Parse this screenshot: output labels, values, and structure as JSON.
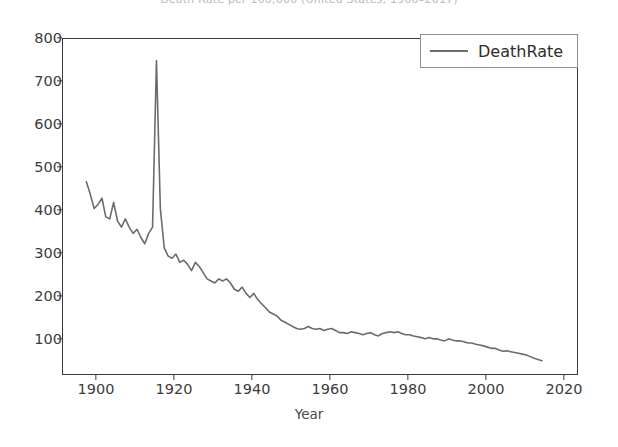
{
  "figure": {
    "clipped_title": "Death Rate per 100,000 (United States, 1900–2017)",
    "background_color": "#ffffff",
    "line_color": "#6b6b6b",
    "axis_color": "#3a3a3a"
  },
  "legend": {
    "position": "upper right",
    "label": "DeathRate",
    "swatch_name": "legend-line-swatch"
  },
  "axes": {
    "xlabel": "Year",
    "ylabel": "",
    "xticks": [
      1900,
      1920,
      1940,
      1960,
      1980,
      2000,
      2020
    ],
    "yticks": [
      100,
      200,
      300,
      400,
      500,
      600,
      700,
      800
    ],
    "xlim": [
      1894,
      2026
    ],
    "ylim": [
      20,
      830
    ],
    "grid": false
  },
  "chart_data": {
    "type": "line",
    "title": "Death Rate per 100,000 (United States, 1900–2017)",
    "xlabel": "Year",
    "ylabel": "",
    "xlim": [
      1894,
      2026
    ],
    "ylim": [
      20,
      830
    ],
    "grid": false,
    "legend_position": "upper right",
    "series": [
      {
        "name": "DeathRate",
        "color": "#6b6b6b",
        "x": [
          1900,
          1901,
          1902,
          1903,
          1904,
          1905,
          1906,
          1907,
          1908,
          1909,
          1910,
          1911,
          1912,
          1913,
          1914,
          1915,
          1916,
          1917,
          1918,
          1919,
          1920,
          1921,
          1922,
          1923,
          1924,
          1925,
          1926,
          1927,
          1928,
          1929,
          1930,
          1931,
          1932,
          1933,
          1934,
          1935,
          1936,
          1937,
          1938,
          1939,
          1940,
          1941,
          1942,
          1943,
          1944,
          1945,
          1946,
          1947,
          1948,
          1949,
          1950,
          1951,
          1952,
          1953,
          1954,
          1955,
          1956,
          1957,
          1958,
          1959,
          1960,
          1961,
          1962,
          1963,
          1964,
          1965,
          1966,
          1967,
          1968,
          1969,
          1970,
          1971,
          1972,
          1973,
          1974,
          1975,
          1976,
          1977,
          1978,
          1979,
          1980,
          1981,
          1982,
          1983,
          1984,
          1985,
          1986,
          1987,
          1988,
          1989,
          1990,
          1991,
          1992,
          1993,
          1994,
          1995,
          1996,
          1997,
          1998,
          1999,
          2000,
          2001,
          2002,
          2003,
          2004,
          2005,
          2006,
          2007,
          2008,
          2009,
          2010,
          2011,
          2012,
          2013,
          2014,
          2015,
          2016,
          2017
        ],
        "values": [
          485,
          455,
          420,
          430,
          445,
          400,
          395,
          435,
          390,
          375,
          395,
          375,
          360,
          370,
          350,
          335,
          360,
          375,
          778,
          420,
          325,
          305,
          300,
          310,
          290,
          295,
          285,
          270,
          290,
          280,
          265,
          250,
          245,
          240,
          250,
          245,
          250,
          240,
          225,
          220,
          230,
          215,
          205,
          215,
          200,
          190,
          180,
          170,
          165,
          160,
          150,
          145,
          140,
          135,
          130,
          128,
          130,
          135,
          130,
          128,
          130,
          125,
          128,
          130,
          125,
          120,
          120,
          118,
          122,
          120,
          118,
          115,
          118,
          120,
          115,
          112,
          118,
          120,
          122,
          120,
          122,
          118,
          115,
          115,
          112,
          110,
          108,
          105,
          108,
          105,
          105,
          102,
          100,
          105,
          102,
          100,
          100,
          98,
          95,
          95,
          92,
          90,
          88,
          85,
          82,
          82,
          78,
          75,
          76,
          74,
          72,
          70,
          68,
          66,
          62,
          58,
          55,
          52
        ]
      }
    ]
  }
}
